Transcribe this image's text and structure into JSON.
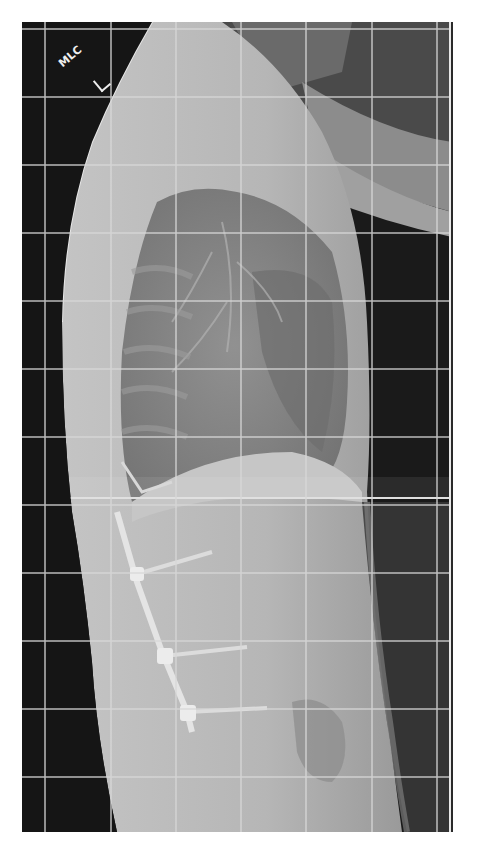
{
  "image": {
    "type": "lateral spine radiograph",
    "marker_text": "MLC",
    "marker_side": "L",
    "grid": {
      "vertical_lines_x": [
        45,
        111,
        176,
        241,
        306,
        372,
        437
      ],
      "horizontal_lines_y": [
        29,
        97,
        165,
        233,
        301,
        369,
        437,
        505,
        573,
        641,
        709,
        777
      ],
      "line_color": "#d8d8d8"
    },
    "colors": {
      "background": "#1a1a1a",
      "soft_tissue": "#b8b8b8",
      "lung": "#7a7a7a",
      "hardware": "#e6e6e6",
      "page": "#ffffff"
    }
  }
}
